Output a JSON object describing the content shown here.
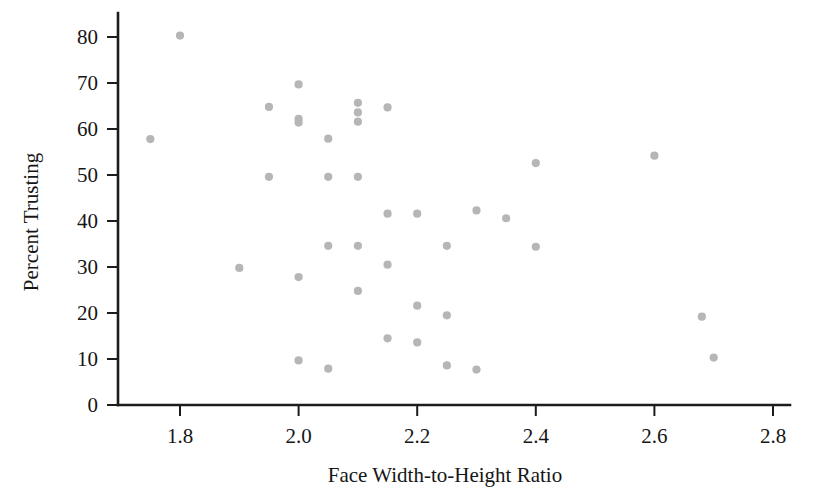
{
  "chart_data": {
    "type": "scatter",
    "title": "",
    "xlabel": "Face Width-to-Height Ratio",
    "ylabel": "Percent Trusting",
    "xlim": [
      1.72,
      2.82
    ],
    "ylim": [
      0,
      84
    ],
    "xticks": [
      "1.8",
      "2.0",
      "2.2",
      "2.4",
      "2.6",
      "2.8"
    ],
    "xtick_values": [
      1.8,
      2.0,
      2.2,
      2.4,
      2.6,
      2.8
    ],
    "yticks": [
      "0",
      "10",
      "20",
      "30",
      "40",
      "50",
      "60",
      "70",
      "80"
    ],
    "ytick_values": [
      0,
      10,
      20,
      30,
      40,
      50,
      60,
      70,
      80
    ],
    "grid": false,
    "legend": false,
    "marker": {
      "shape": "circle",
      "color": "#b6b6b6",
      "radius_px": 4.1
    },
    "n_points": 40,
    "x": [
      1.75,
      1.8,
      1.9,
      1.95,
      1.95,
      2.0,
      2.0,
      2.0,
      2.0,
      2.0,
      2.05,
      2.05,
      2.05,
      2.05,
      2.05,
      2.1,
      2.1,
      2.1,
      2.1,
      2.1,
      2.1,
      2.1,
      2.15,
      2.15,
      2.15,
      2.15,
      2.2,
      2.2,
      2.2,
      2.25,
      2.25,
      2.25,
      2.25,
      2.3,
      2.3,
      2.35,
      2.4,
      2.4,
      2.6,
      2.68,
      2.7
    ],
    "y": [
      57.8,
      80.3,
      29.8,
      64.8,
      49.6,
      69.7,
      62.2,
      61.4,
      27.8,
      9.7,
      57.9,
      49.6,
      34.6,
      24.8,
      7.9,
      65.7,
      63.6,
      61.6,
      49.6,
      34.6,
      24.8,
      14.5,
      64.7,
      41.6,
      30.5,
      14.5,
      41.6,
      21.6,
      13.6,
      34.6,
      19.5,
      8.6,
      8.6,
      42.3,
      7.7,
      40.6,
      52.6,
      34.4,
      54.2,
      19.2,
      10.3
    ],
    "points": [
      {
        "x": 1.75,
        "y": 57.8
      },
      {
        "x": 1.8,
        "y": 80.3
      },
      {
        "x": 1.9,
        "y": 29.8
      },
      {
        "x": 1.95,
        "y": 64.8
      },
      {
        "x": 1.95,
        "y": 49.6
      },
      {
        "x": 2.0,
        "y": 69.7
      },
      {
        "x": 2.0,
        "y": 62.2
      },
      {
        "x": 2.0,
        "y": 61.4
      },
      {
        "x": 2.0,
        "y": 27.8
      },
      {
        "x": 2.0,
        "y": 9.7
      },
      {
        "x": 2.05,
        "y": 57.9
      },
      {
        "x": 2.05,
        "y": 49.6
      },
      {
        "x": 2.05,
        "y": 34.6
      },
      {
        "x": 2.05,
        "y": 7.9
      },
      {
        "x": 2.1,
        "y": 65.7
      },
      {
        "x": 2.1,
        "y": 63.6
      },
      {
        "x": 2.1,
        "y": 61.6
      },
      {
        "x": 2.1,
        "y": 49.6
      },
      {
        "x": 2.1,
        "y": 34.6
      },
      {
        "x": 2.1,
        "y": 24.8
      },
      {
        "x": 2.15,
        "y": 64.7
      },
      {
        "x": 2.15,
        "y": 41.6
      },
      {
        "x": 2.15,
        "y": 30.5
      },
      {
        "x": 2.15,
        "y": 14.5
      },
      {
        "x": 2.2,
        "y": 41.6
      },
      {
        "x": 2.2,
        "y": 21.6
      },
      {
        "x": 2.2,
        "y": 13.6
      },
      {
        "x": 2.25,
        "y": 34.6
      },
      {
        "x": 2.25,
        "y": 19.5
      },
      {
        "x": 2.25,
        "y": 8.6
      },
      {
        "x": 2.3,
        "y": 42.3
      },
      {
        "x": 2.3,
        "y": 7.7
      },
      {
        "x": 2.35,
        "y": 40.6
      },
      {
        "x": 2.4,
        "y": 52.6
      },
      {
        "x": 2.4,
        "y": 34.4
      },
      {
        "x": 2.6,
        "y": 54.2
      },
      {
        "x": 2.68,
        "y": 19.2
      },
      {
        "x": 2.7,
        "y": 10.3
      }
    ]
  },
  "colors": {
    "background": "#ffffff",
    "axis": "#1c1c1c",
    "text": "#161616",
    "marker": "#b6b6b6"
  }
}
